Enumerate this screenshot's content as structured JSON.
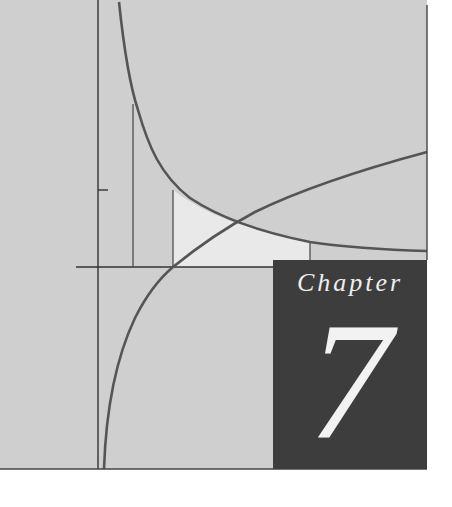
{
  "cover": {
    "chapter_label": "Chapter",
    "chapter_number": "7"
  },
  "colors": {
    "panel": "#cfcfcf",
    "shaded_region": "#e9e9e9",
    "curve": "#555555",
    "axis": "#333333",
    "chapter_box": "#3d3d3d",
    "chapter_text": "#eeeeee"
  },
  "illustration": {
    "curves": [
      "hyperbola y=1/x",
      "logarithm y=ln x"
    ],
    "y_axis_tick": "1"
  }
}
